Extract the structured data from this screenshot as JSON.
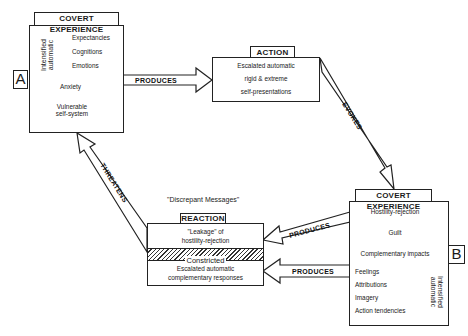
{
  "diagram": {
    "node_a": {
      "tab": "COVERT EXPERIENCE",
      "side_label": "A",
      "vertical_label_1": "Intensified",
      "vertical_label_2": "automatic",
      "items": [
        "Expectancies",
        "Cognitions",
        "Emotions"
      ],
      "anxiety": "Anxiety",
      "vulnerable_1": "Vulnerable",
      "vulnerable_2": "self-system"
    },
    "action": {
      "tab": "ACTION",
      "lines": [
        "Escalated automatic",
        "rigid & extreme",
        "self-presentations"
      ]
    },
    "node_b": {
      "tab": "COVERT EXPERIENCE",
      "side_label": "B",
      "chain": [
        "Hostility-rejection",
        "Guilt",
        "Complementary impacts"
      ],
      "items": [
        "Feelings",
        "Attributions",
        "Imagery",
        "Action tendencies"
      ],
      "vertical_label_1": "Intensified",
      "vertical_label_2": "automatic"
    },
    "reaction": {
      "tab": "REACTION",
      "caption": "\"Discrepant Messages\"",
      "leakage_1": "\"Leakage\" of",
      "leakage_2": "hostility-rejection",
      "constricted": "Constricted",
      "escalated_1": "Escalated automatic",
      "escalated_2": "complementary responses"
    },
    "arrows": {
      "a_to_action": "PRODUCES",
      "action_to_b": "EVOKES",
      "b_to_reaction_upper": "PRODUCES",
      "b_to_reaction_lower": "PRODUCES",
      "reaction_to_a": "THREATENS"
    }
  }
}
